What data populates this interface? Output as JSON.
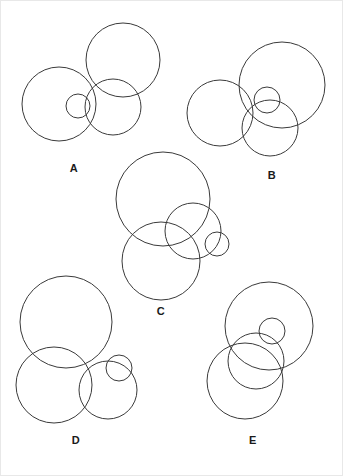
{
  "figure": {
    "background_color": "#ffffff",
    "stroke_color": "#3a3a3a",
    "label_color": "#1a1a1a",
    "stroke_width": 1,
    "width": 343,
    "height": 476
  },
  "panels": [
    {
      "id": "A",
      "label": "A",
      "label_x": 74,
      "label_y": 168,
      "circles": [
        {
          "name": "large-left-circle",
          "cx": 59,
          "cy": 104,
          "r": 37
        },
        {
          "name": "large-top-circle",
          "cx": 123,
          "cy": 60,
          "r": 37
        },
        {
          "name": "medium-circle",
          "cx": 113,
          "cy": 107,
          "r": 28
        },
        {
          "name": "small-circle",
          "cx": 78,
          "cy": 106,
          "r": 12
        }
      ]
    },
    {
      "id": "B",
      "label": "B",
      "label_x": 272,
      "label_y": 175,
      "circles": [
        {
          "name": "large-top-right-circle",
          "cx": 282,
          "cy": 85,
          "r": 43
        },
        {
          "name": "large-left-circle",
          "cx": 220,
          "cy": 113,
          "r": 33
        },
        {
          "name": "medium-circle",
          "cx": 270,
          "cy": 128,
          "r": 28
        },
        {
          "name": "small-circle",
          "cx": 267,
          "cy": 100,
          "r": 13
        }
      ]
    },
    {
      "id": "C",
      "label": "C",
      "label_x": 161,
      "label_y": 311,
      "circles": [
        {
          "name": "large-top-circle",
          "cx": 163,
          "cy": 199,
          "r": 47
        },
        {
          "name": "large-bottom-circle",
          "cx": 161,
          "cy": 261,
          "r": 39
        },
        {
          "name": "medium-circle",
          "cx": 193,
          "cy": 231,
          "r": 28
        },
        {
          "name": "small-circle",
          "cx": 217,
          "cy": 244,
          "r": 12
        }
      ]
    },
    {
      "id": "D",
      "label": "D",
      "label_x": 76,
      "label_y": 440,
      "circles": [
        {
          "name": "large-top-circle",
          "cx": 66,
          "cy": 322,
          "r": 46
        },
        {
          "name": "large-bottom-left-circle",
          "cx": 54,
          "cy": 385,
          "r": 38
        },
        {
          "name": "medium-circle",
          "cx": 108,
          "cy": 390,
          "r": 29
        },
        {
          "name": "small-circle",
          "cx": 119,
          "cy": 368,
          "r": 13
        }
      ]
    },
    {
      "id": "E",
      "label": "E",
      "label_x": 253,
      "label_y": 440,
      "circles": [
        {
          "name": "large-top-right-circle",
          "cx": 269,
          "cy": 326,
          "r": 44
        },
        {
          "name": "large-bottom-left-circle",
          "cx": 245,
          "cy": 381,
          "r": 38
        },
        {
          "name": "medium-circle",
          "cx": 256,
          "cy": 361,
          "r": 28
        },
        {
          "name": "small-circle",
          "cx": 272,
          "cy": 331,
          "r": 13
        }
      ]
    }
  ]
}
